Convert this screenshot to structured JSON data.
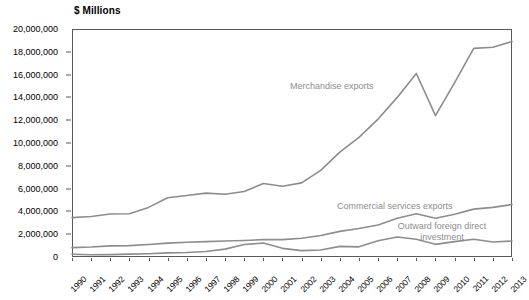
{
  "axis_unit_title": "$ Millions",
  "colors": {
    "line": "#8d8d8d",
    "frame": "#58595b",
    "label_text": "#000000",
    "annotation_text": "#8d8d8d",
    "background": "#ffffff"
  },
  "annotations": {
    "merchandise": "Merchandise exports",
    "commercial_services": "Commercial services exports",
    "outward_fdi_line1": "Outward foreign direct",
    "outward_fdi_line2": "investment"
  },
  "y_axis": {
    "labels": [
      "20,000,000",
      "18,000,000",
      "16,000,000",
      "14,000,000",
      "12,000,000",
      "10,000,000",
      "8,000,000",
      "6,000,000",
      "4,000,000",
      "2,000,000",
      "0"
    ],
    "values": [
      20000000,
      18000000,
      16000000,
      14000000,
      12000000,
      10000000,
      8000000,
      6000000,
      4000000,
      2000000,
      0
    ]
  },
  "x_axis": {
    "labels": [
      "1990",
      "1991",
      "1992",
      "1993",
      "1994",
      "1995",
      "1996",
      "1997",
      "1998",
      "1999",
      "2000",
      "2001",
      "2002",
      "2003",
      "2004",
      "2005",
      "2006",
      "2007",
      "2008",
      "2009",
      "2010",
      "2011",
      "2012",
      "2013"
    ]
  },
  "chart_data": {
    "type": "line",
    "title": "",
    "xlabel": "",
    "ylabel": "$ Millions",
    "ylim": [
      0,
      20000000
    ],
    "grid": false,
    "legend_position": "inline-annotations",
    "categories": [
      "1990",
      "1991",
      "1992",
      "1993",
      "1994",
      "1995",
      "1996",
      "1997",
      "1998",
      "1999",
      "2000",
      "2001",
      "2002",
      "2003",
      "2004",
      "2005",
      "2006",
      "2007",
      "2008",
      "2009",
      "2010",
      "2011",
      "2012",
      "2013"
    ],
    "series": [
      {
        "name": "Merchandise exports",
        "color": "#8d8d8d",
        "values": [
          3450000,
          3550000,
          3770000,
          3800000,
          4350000,
          5200000,
          5400000,
          5600000,
          5500000,
          5750000,
          6450000,
          6200000,
          6500000,
          7600000,
          9200000,
          10500000,
          12100000,
          14000000,
          16100000,
          12400000,
          15300000,
          18300000,
          18400000,
          18900000
        ]
      },
      {
        "name": "Commercial services exports",
        "color": "#8d8d8d",
        "values": [
          820000,
          880000,
          980000,
          1000000,
          1100000,
          1220000,
          1300000,
          1350000,
          1400000,
          1450000,
          1520000,
          1520000,
          1640000,
          1880000,
          2250000,
          2500000,
          2800000,
          3400000,
          3800000,
          3400000,
          3750000,
          4200000,
          4350000,
          4600000
        ]
      },
      {
        "name": "Outward foreign direct investment",
        "color": "#8d8d8d",
        "values": [
          240000,
          200000,
          210000,
          250000,
          290000,
          360000,
          400000,
          480000,
          690000,
          1090000,
          1230000,
          760000,
          560000,
          620000,
          930000,
          890000,
          1420000,
          1750000,
          1550000,
          1110000,
          1350000,
          1550000,
          1320000,
          1400000
        ]
      }
    ]
  }
}
